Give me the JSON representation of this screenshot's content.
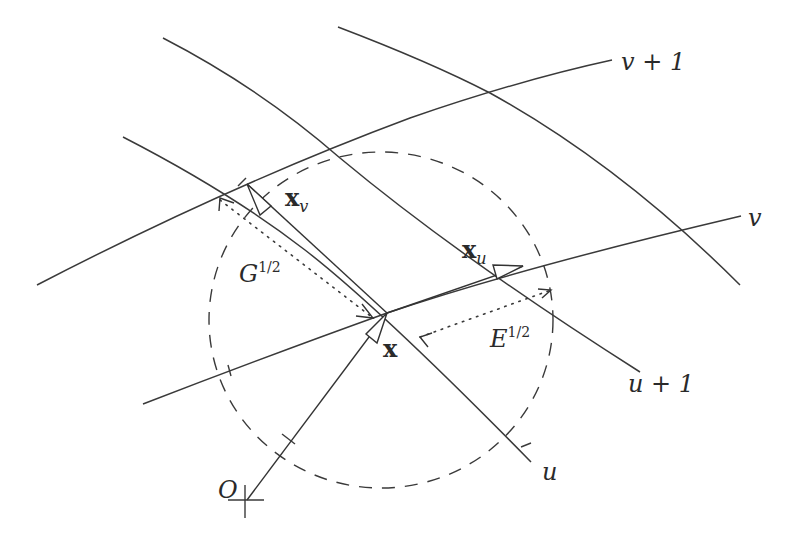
{
  "diagram": {
    "title": "",
    "colors": {
      "line": "#3a3a3a",
      "background": "#ffffff"
    },
    "labels": {
      "v_plus_1": "v + 1",
      "v": "v",
      "u": "u",
      "u_plus_1": "u + 1",
      "origin": "O",
      "x": "x",
      "x_u_base": "x",
      "x_u_sub": "u",
      "x_v_base": "x",
      "x_v_sub": "v",
      "G_base": "G",
      "G_sup": "1/2",
      "E_base": "E",
      "E_sup": "1/2"
    },
    "elements": {
      "coordinate_curves_u": [
        "u",
        "u + 1",
        "u + 2"
      ],
      "coordinate_curves_v": [
        "v",
        "v + 1"
      ],
      "vectors": [
        "x",
        "x_u",
        "x_v"
      ],
      "distance_markers": [
        "E^1/2",
        "G^1/2"
      ],
      "unit_circle": "dashed circle centered at x"
    }
  }
}
